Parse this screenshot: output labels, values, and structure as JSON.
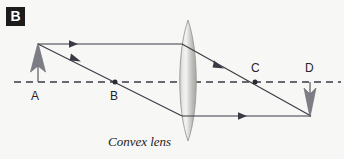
{
  "figure": {
    "panel_label": "B",
    "caption": "Convex lens",
    "background_color": "#f7f7f5",
    "ink_color": "#3a3a44",
    "labels": {
      "object_point": "A",
      "focal_point_near": "B",
      "focal_point_far": "C",
      "image_point": "D"
    }
  },
  "diagram_data": {
    "type": "optics-ray-diagram",
    "element": "convex lens",
    "principal_axis": {
      "y": 82,
      "x_start": 14,
      "x_end": 340,
      "style": "dashed"
    },
    "lens": {
      "center_x": 188,
      "half_width": 10,
      "top_y": 20,
      "bottom_y": 141
    },
    "object": {
      "label": "A",
      "x": 38,
      "base_y": 82,
      "tip_y": 44,
      "direction": "up",
      "upright": true
    },
    "image": {
      "label": "D",
      "x": 310,
      "base_y": 82,
      "tip_y": 116,
      "direction": "down",
      "inverted": true
    },
    "points_on_axis": [
      {
        "label": "A",
        "x": 38,
        "y": 82,
        "marked": false
      },
      {
        "label": "B",
        "x": 115,
        "y": 82,
        "marked": true
      },
      {
        "label": "C",
        "x": 255,
        "y": 82,
        "marked": true
      },
      {
        "label": "D",
        "x": 310,
        "y": 82,
        "marked": false
      }
    ],
    "rays": [
      {
        "name": "parallel-incident-ray",
        "from": [
          38,
          44
        ],
        "to": [
          181,
          44
        ],
        "arrow_at": [
          73,
          44
        ]
      },
      {
        "name": "refracted-ray-through-far-focus",
        "from": [
          181,
          44
        ],
        "to": [
          310,
          116
        ],
        "arrow_at": [
          222,
          67
        ]
      },
      {
        "name": "incident-ray-through-near-focus",
        "from": [
          38,
          44
        ],
        "to": [
          181,
          116
        ],
        "arrow_at": [
          78,
          60
        ]
      },
      {
        "name": "refracted-parallel-ray",
        "from": [
          181,
          116
        ],
        "to": [
          310,
          116
        ],
        "arrow_at": [
          246,
          116
        ]
      }
    ]
  }
}
